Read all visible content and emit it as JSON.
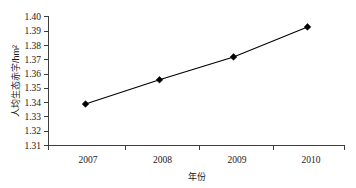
{
  "chart_data": {
    "type": "line",
    "title": "",
    "subtitle": "",
    "xlabel": "年份",
    "ylabel": "人均生态赤字/hm²",
    "categories": [
      "2007",
      "2008",
      "2009",
      "2010"
    ],
    "x": [
      2007,
      2008,
      2009,
      2010
    ],
    "values": [
      1.339,
      1.356,
      1.372,
      1.393
    ],
    "series": [
      {
        "name": "人均生态赤字",
        "values": [
          1.339,
          1.356,
          1.372,
          1.393
        ],
        "marker": "diamond",
        "color": "#000000"
      }
    ],
    "ylim": [
      1.31,
      1.4
    ],
    "xlim": [
      2006.5,
      2010.5
    ],
    "yticks": [
      "1.31",
      "1.32",
      "1.33",
      "1.34",
      "1.35",
      "1.36",
      "1.37",
      "1.38",
      "1.39",
      "1.40"
    ],
    "ytick_values": [
      1.31,
      1.32,
      1.33,
      1.34,
      1.35,
      1.36,
      1.37,
      1.38,
      1.39,
      1.4
    ],
    "xticks": [
      "2007",
      "2008",
      "2009",
      "2010"
    ],
    "grid": false,
    "legend": "none",
    "axis_color": "#3d3d3d",
    "line_color": "#000000"
  },
  "axes": {
    "y_title": "人均生态赤字/hm²",
    "x_title": "年份"
  },
  "ytick_labels": {
    "t0": "1.31",
    "t1": "1.32",
    "t2": "1.33",
    "t3": "1.34",
    "t4": "1.35",
    "t5": "1.36",
    "t6": "1.37",
    "t7": "1.38",
    "t8": "1.39",
    "t9": "1.40"
  },
  "xtick_labels": {
    "t0": "2007",
    "t1": "2008",
    "t2": "2009",
    "t3": "2010"
  }
}
